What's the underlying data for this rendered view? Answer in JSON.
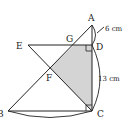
{
  "diagram": {
    "points": {
      "A": {
        "label": "A",
        "x": 92,
        "y": 25
      },
      "B": {
        "label": "B",
        "x": 8,
        "y": 111
      },
      "C": {
        "label": "C",
        "x": 92,
        "y": 111
      },
      "D": {
        "label": "D",
        "x": 92,
        "y": 45
      },
      "E": {
        "label": "E",
        "x": 28,
        "y": 45
      },
      "F": {
        "label": "F",
        "x": 50,
        "y": 68
      },
      "G": {
        "label": "G",
        "x": 74,
        "y": 45
      }
    },
    "measurements": {
      "AD": "6 cm",
      "DC": "13 cm",
      "BC": "18"
    },
    "shaded_region": [
      "G",
      "D",
      "C",
      "F"
    ],
    "shade_color": "#d4d4d4",
    "line_color": "#222222"
  }
}
